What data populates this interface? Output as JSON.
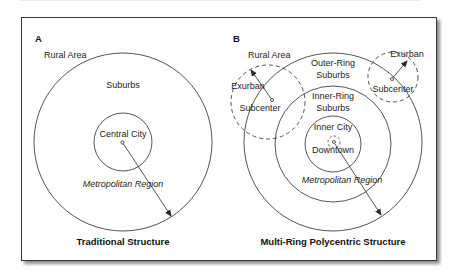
{
  "panels": [
    {
      "letter": "A",
      "caption": "Traditional Structure",
      "labels": {
        "rural": "Rural Area",
        "suburbs": "Suburbs",
        "central_city": "Central City",
        "metro": "Metropolitan Region"
      }
    },
    {
      "letter": "B",
      "caption": "Multi-Ring Polycentric Structure",
      "labels": {
        "rural": "Rural Area",
        "outer_ring_1": "Outer-Ring",
        "outer_ring_2": "Suburbs",
        "inner_ring_1": "Inner-Ring",
        "inner_ring_2": "Suburbs",
        "inner_city": "Inner City",
        "downtown": "Downtown",
        "metro": "Metropolitan Region",
        "exurban_left": "Exurban",
        "subcenter_left": "Subcenter",
        "exurban_right": "Exurban",
        "subcenter_right": "Subcenter"
      }
    }
  ],
  "colors": {
    "line": "#2a2a2a",
    "text": "#222222"
  }
}
